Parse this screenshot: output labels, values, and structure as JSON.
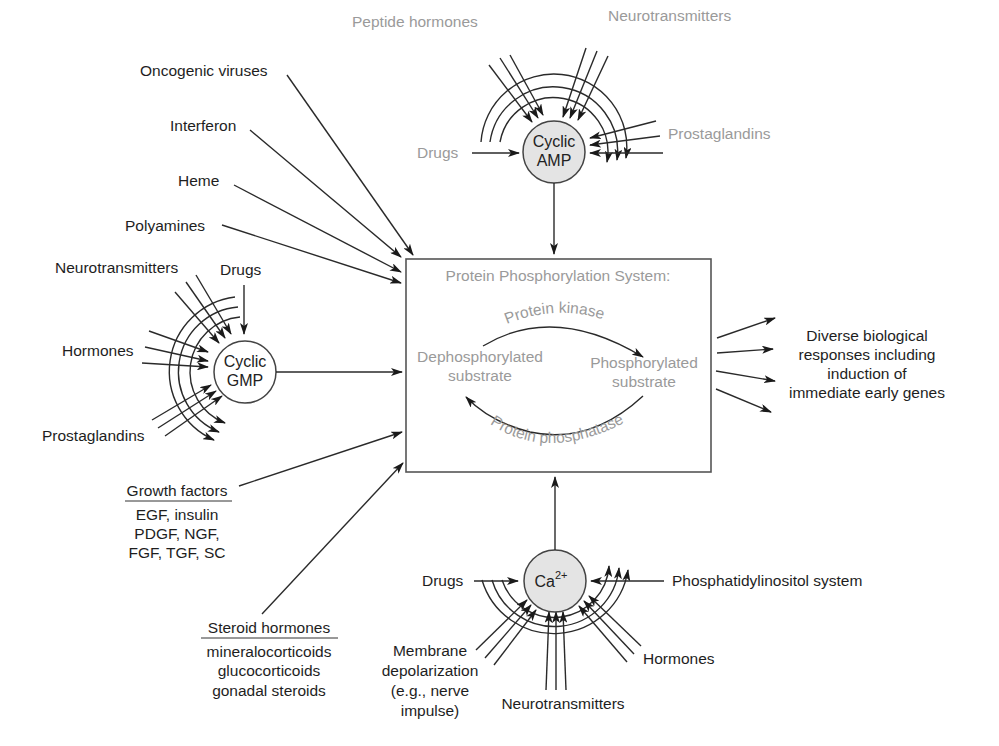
{
  "diagram": {
    "central_box": {
      "title": "Protein Phosphorylation System:",
      "left_state": [
        "Dephosphorylated",
        "substrate"
      ],
      "right_state": [
        "Phosphorylated",
        "substrate"
      ],
      "forward_enzyme": "Protein kinase",
      "reverse_enzyme": "Protein phosphatase"
    },
    "cyclic_amp": {
      "node": [
        "Cyclic",
        "AMP"
      ],
      "fill": "#e4e4e4",
      "inputs": {
        "peptide_hormones": "Peptide hormones",
        "neurotransmitters": "Neurotransmitters",
        "prostaglandins": "Prostaglandins",
        "drugs": "Drugs"
      }
    },
    "cyclic_gmp": {
      "node": [
        "Cyclic",
        "GMP"
      ],
      "fill": "#ffffff",
      "inputs": {
        "neurotransmitters": "Neurotransmitters",
        "drugs": "Drugs",
        "hormones": "Hormones",
        "prostaglandins": "Prostaglandins"
      }
    },
    "calcium": {
      "node_base": "Ca",
      "node_sup": "2+",
      "fill": "#e4e4e4",
      "inputs": {
        "drugs": "Drugs",
        "phosphatidylinositol": "Phosphatidylinositol system",
        "hormones": "Hormones",
        "neurotransmitters": "Neurotransmitters",
        "membrane_depolarization": [
          "Membrane",
          "depolarization",
          "(e.g., nerve",
          "impulse)"
        ]
      }
    },
    "direct_inputs": {
      "oncogenic_viruses": "Oncogenic viruses",
      "interferon": "Interferon",
      "heme": "Heme",
      "polyamines": "Polyamines",
      "growth_factors": {
        "heading": "Growth factors",
        "items": [
          "EGF, insulin",
          "PDGF, NGF,",
          "FGF, TGF, SC"
        ]
      },
      "steroid_hormones": {
        "heading": "Steroid hormones",
        "items": [
          "mineralocorticoids",
          "glucocorticoids",
          "gonadal steroids"
        ]
      }
    },
    "output": [
      "Diverse biological",
      "responses including",
      "induction of",
      "immediate early genes"
    ],
    "colors": {
      "line": "#2a2a2a",
      "black_text": "#1e1e1e",
      "gray_text": "#9a9a9a",
      "node_fill": "#e4e4e4"
    }
  }
}
